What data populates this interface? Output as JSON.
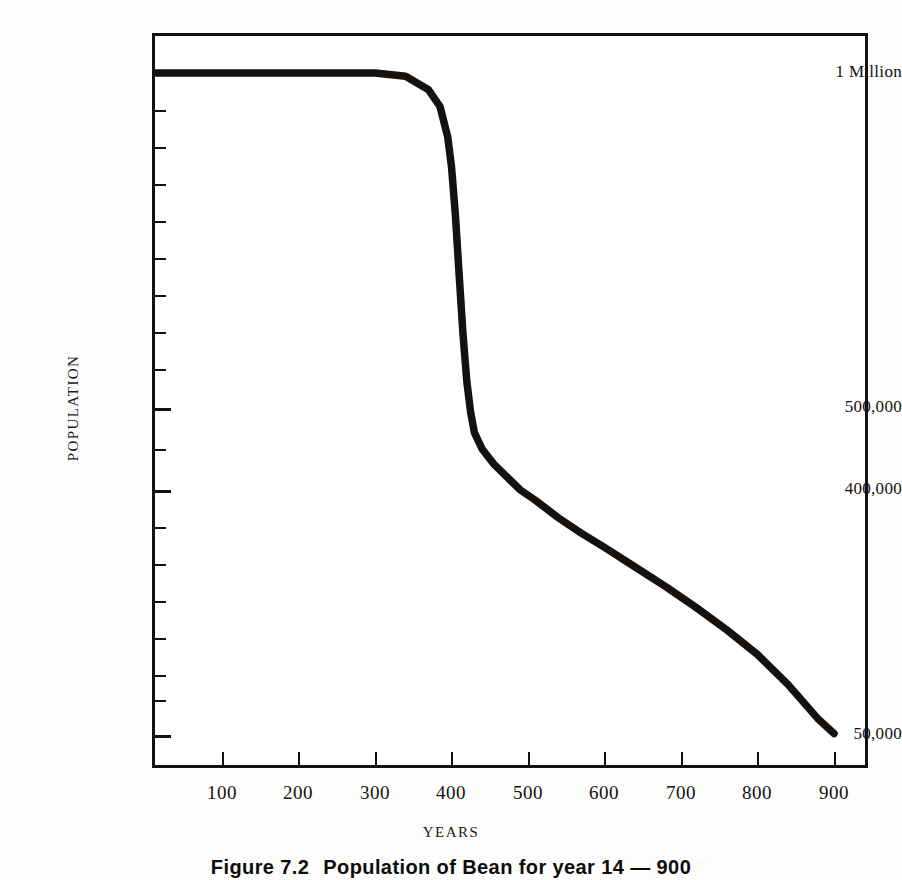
{
  "figure": {
    "caption_label": "Figure 7.2",
    "caption_text": "Population of Bean for year 14 — 900"
  },
  "axes": {
    "y_title": "POPULATION",
    "x_title": "YEARS",
    "y_labels": [
      {
        "text": "1 Million",
        "y": 73
      },
      {
        "text": "500,000",
        "y": 408
      },
      {
        "text": "400,000",
        "y": 490
      },
      {
        "text": "50,000",
        "y": 735
      }
    ],
    "y_tick_positions": [
      73,
      110,
      147,
      184,
      221,
      258,
      295,
      332,
      369,
      408,
      445,
      490,
      527,
      564,
      601,
      638,
      675,
      700,
      735
    ],
    "y_major_ticks": [
      73,
      408,
      490,
      735
    ],
    "x_labels": [
      "100",
      "200",
      "300",
      "400",
      "500",
      "600",
      "700",
      "800",
      "900"
    ],
    "x_tick_positions": [
      222,
      298,
      375,
      451,
      528,
      604,
      681,
      757,
      834
    ]
  },
  "style": {
    "curve_color": "#14110f",
    "frame_color": "#14110f",
    "paper_color": "#fdfdfc"
  },
  "chart_data": {
    "type": "line",
    "title": "Population of Bean for year 14 — 900",
    "xlabel": "YEARS",
    "ylabel": "POPULATION",
    "xlim": [
      0,
      950
    ],
    "ylim": [
      50000,
      1000000
    ],
    "grid": false,
    "legend": null,
    "y_tick_labels": [
      "1 Million",
      "500,000",
      "400,000",
      "50,000"
    ],
    "x_tick_labels": [
      100,
      200,
      300,
      400,
      500,
      600,
      700,
      800,
      900
    ],
    "series": [
      {
        "name": "Population",
        "x": [
          14,
          50,
          100,
          150,
          200,
          250,
          300,
          340,
          370,
          385,
          395,
          400,
          405,
          410,
          415,
          420,
          425,
          430,
          440,
          455,
          470,
          490,
          510,
          540,
          570,
          600,
          640,
          680,
          720,
          760,
          800,
          840,
          880,
          900
        ],
        "y": [
          1000000,
          1000000,
          1000000,
          1000000,
          1000000,
          1000000,
          1000000,
          995000,
          975000,
          950000,
          905000,
          860000,
          790000,
          700000,
          610000,
          540000,
          495000,
          470000,
          450000,
          432000,
          418000,
          400000,
          385000,
          360000,
          338000,
          318000,
          290000,
          262000,
          232000,
          200000,
          165000,
          122000,
          72000,
          52000
        ]
      }
    ],
    "annotations": [
      {
        "text": "plateau at 1 Million until ~year 390",
        "x": 200,
        "y": 1000000
      },
      {
        "text": "steep collapse between year 390 and 430",
        "x": 410,
        "y": 600000
      },
      {
        "text": "gradual decline to 50,000 by year 900",
        "x": 750,
        "y": 150000
      }
    ]
  }
}
